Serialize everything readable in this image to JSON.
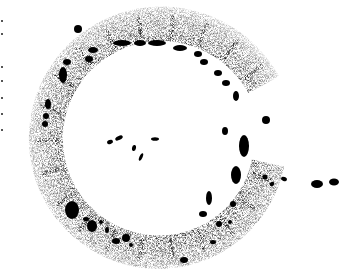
{
  "image": {
    "description": "Stippled grayscale micrograph of a C-shaped ring structure with dark blobs along its inner edge and scattered dark fragments inside and to the right",
    "width": 347,
    "height": 269,
    "colors": {
      "background": "#ffffff",
      "stipple": "#3a3a3a",
      "blob": "#000000"
    },
    "ring": {
      "center": [
        160,
        140
      ],
      "outer_radius": 135,
      "inner_radius": 100,
      "open_side": "right"
    },
    "blobs": [
      {
        "cx": 78,
        "cy": 29,
        "rx": 4,
        "ry": 4
      },
      {
        "cx": 122,
        "cy": 43,
        "rx": 9,
        "ry": 3
      },
      {
        "cx": 140,
        "cy": 43,
        "rx": 6,
        "ry": 3
      },
      {
        "cx": 157,
        "cy": 43,
        "rx": 9,
        "ry": 3
      },
      {
        "cx": 180,
        "cy": 48,
        "rx": 7,
        "ry": 3
      },
      {
        "cx": 198,
        "cy": 54,
        "rx": 4,
        "ry": 3
      },
      {
        "cx": 204,
        "cy": 62,
        "rx": 4,
        "ry": 3
      },
      {
        "cx": 218,
        "cy": 73,
        "rx": 4,
        "ry": 3
      },
      {
        "cx": 226,
        "cy": 83,
        "rx": 4,
        "ry": 3
      },
      {
        "cx": 236,
        "cy": 96,
        "rx": 3,
        "ry": 5
      },
      {
        "cx": 266,
        "cy": 120,
        "rx": 4,
        "ry": 4
      },
      {
        "cx": 93,
        "cy": 50,
        "rx": 5,
        "ry": 3
      },
      {
        "cx": 89,
        "cy": 59,
        "rx": 4,
        "ry": 3
      },
      {
        "cx": 67,
        "cy": 62,
        "rx": 4,
        "ry": 3
      },
      {
        "cx": 63,
        "cy": 75,
        "rx": 4,
        "ry": 8
      },
      {
        "cx": 48,
        "cy": 104,
        "rx": 3,
        "ry": 5
      },
      {
        "cx": 46,
        "cy": 116,
        "rx": 3,
        "ry": 3
      },
      {
        "cx": 45,
        "cy": 124,
        "rx": 3,
        "ry": 3
      },
      {
        "cx": 244,
        "cy": 146,
        "rx": 5,
        "ry": 11
      },
      {
        "cx": 236,
        "cy": 175,
        "rx": 5,
        "ry": 9
      },
      {
        "cx": 225,
        "cy": 131,
        "rx": 3,
        "ry": 4
      },
      {
        "cx": 72,
        "cy": 210,
        "rx": 7,
        "ry": 9
      },
      {
        "cx": 92,
        "cy": 226,
        "rx": 5,
        "ry": 6
      },
      {
        "cx": 86,
        "cy": 219,
        "rx": 3,
        "ry": 2
      },
      {
        "cx": 101,
        "cy": 222,
        "rx": 2,
        "ry": 2
      },
      {
        "cx": 107,
        "cy": 230,
        "rx": 2,
        "ry": 3
      },
      {
        "cx": 116,
        "cy": 241,
        "rx": 4,
        "ry": 3
      },
      {
        "cx": 126,
        "cy": 238,
        "rx": 4,
        "ry": 4
      },
      {
        "cx": 131,
        "cy": 245,
        "rx": 2,
        "ry": 2
      },
      {
        "cx": 209,
        "cy": 198,
        "rx": 3,
        "ry": 7
      },
      {
        "cx": 203,
        "cy": 214,
        "rx": 4,
        "ry": 3
      },
      {
        "cx": 219,
        "cy": 224,
        "rx": 3,
        "ry": 3
      },
      {
        "cx": 213,
        "cy": 242,
        "rx": 3,
        "ry": 2
      },
      {
        "cx": 184,
        "cy": 260,
        "rx": 4,
        "ry": 3
      },
      {
        "cx": 230,
        "cy": 222,
        "rx": 2,
        "ry": 2
      },
      {
        "cx": 233,
        "cy": 204,
        "rx": 3,
        "ry": 3
      }
    ],
    "fragments": [
      {
        "cx": 110,
        "cy": 142,
        "rx": 3,
        "ry": 2,
        "rot": -20
      },
      {
        "cx": 119,
        "cy": 138,
        "rx": 4,
        "ry": 2,
        "rot": -25
      },
      {
        "cx": 134,
        "cy": 148,
        "rx": 2,
        "ry": 3,
        "rot": 10
      },
      {
        "cx": 141,
        "cy": 157,
        "rx": 1.5,
        "ry": 4,
        "rot": 25
      },
      {
        "cx": 155,
        "cy": 139,
        "rx": 4,
        "ry": 1.8,
        "rot": 0
      },
      {
        "cx": 265,
        "cy": 177,
        "rx": 2.5,
        "ry": 2.5,
        "rot": 0
      },
      {
        "cx": 272,
        "cy": 184,
        "rx": 2.5,
        "ry": 2,
        "rot": -30
      },
      {
        "cx": 284,
        "cy": 179,
        "rx": 3,
        "ry": 2,
        "rot": 20
      },
      {
        "cx": 317,
        "cy": 184,
        "rx": 6,
        "ry": 4,
        "rot": 0
      },
      {
        "cx": 334,
        "cy": 182,
        "rx": 5,
        "ry": 3.5,
        "rot": 0
      }
    ],
    "edge_marks": [
      {
        "x": 1,
        "y": 20
      },
      {
        "x": 1,
        "y": 33
      },
      {
        "x": 1,
        "y": 66
      },
      {
        "x": 1,
        "y": 80
      },
      {
        "x": 1,
        "y": 97
      },
      {
        "x": 1,
        "y": 113
      },
      {
        "x": 1,
        "y": 129
      }
    ]
  }
}
